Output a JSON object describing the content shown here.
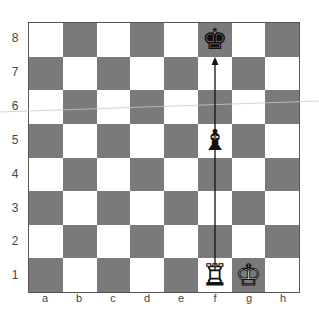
{
  "diagram": {
    "ranks": [
      "8",
      "7",
      "6",
      "5",
      "4",
      "3",
      "2",
      "1"
    ],
    "files": [
      "a",
      "b",
      "c",
      "d",
      "e",
      "f",
      "g",
      "h"
    ],
    "square_colors": {
      "light": "#ffffff",
      "dark": "#7a7a7a"
    },
    "pieces": [
      {
        "square": "f8",
        "piece": "king",
        "color": "black",
        "glyph": "♚"
      },
      {
        "square": "f5",
        "piece": "bishop",
        "color": "black",
        "glyph": "♝"
      },
      {
        "square": "f1",
        "piece": "rook",
        "color": "white",
        "glyph": "♖"
      },
      {
        "square": "g1",
        "piece": "king",
        "color": "white",
        "glyph": "♔"
      }
    ],
    "arrows": [
      {
        "from": "f1",
        "to": "f8",
        "color": "#111111"
      }
    ]
  }
}
